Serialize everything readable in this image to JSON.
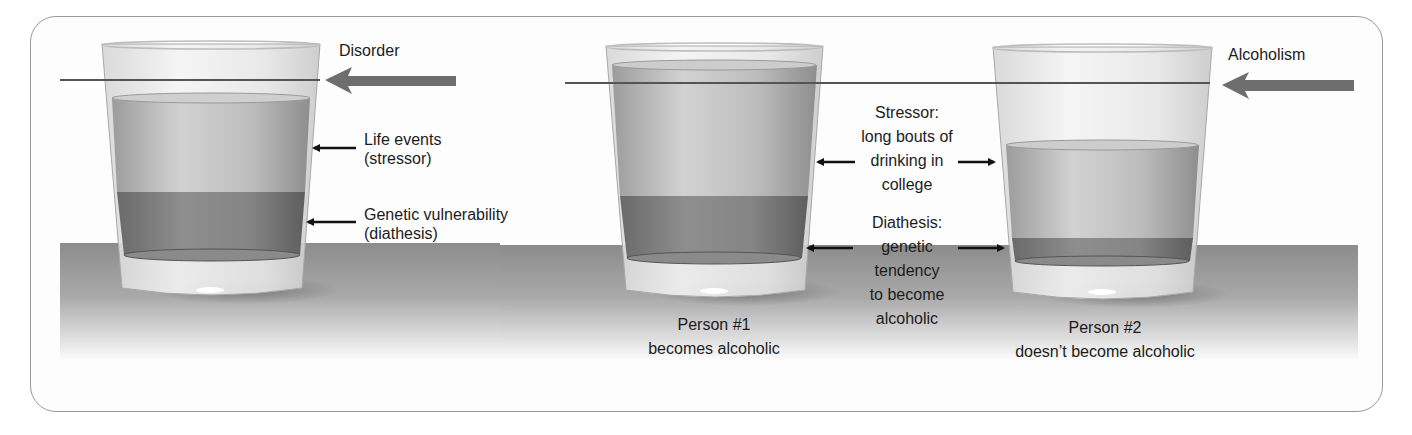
{
  "figure": {
    "panel_left": {
      "threshold_label": "Disorder",
      "annotations": [
        {
          "line1": "Life events",
          "line2": "(stressor)"
        },
        {
          "line1": "Genetic vulnerability",
          "line2": "(diathesis)"
        }
      ]
    },
    "panel_right": {
      "threshold_label": "Alcoholism",
      "stressor_label": [
        "Stressor:",
        "long bouts of",
        "drinking in",
        "college"
      ],
      "diathesis_label": [
        "Diathesis:",
        "genetic",
        "tendency",
        "to become",
        "alcoholic"
      ],
      "person1": {
        "line1": "Person #1",
        "line2": "becomes alcoholic"
      },
      "person2": {
        "line1": "Person #2",
        "line2": "doesn’t become alcoholic"
      }
    },
    "colors": {
      "frame": "#9a9a9a",
      "table": "#8f8f8f",
      "stressor_liquid": "#b8b8b8",
      "diathesis_liquid": "#7a7a7a",
      "threshold_line": "#555555",
      "big_arrow": "#6e6e6e",
      "pointer_arrow": "#111111",
      "text": "#1c1c1c"
    }
  }
}
